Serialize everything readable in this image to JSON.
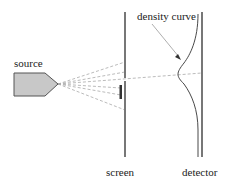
{
  "labels": {
    "source": "source",
    "density_curve": "density curve",
    "screen": "screen",
    "detector": "detector"
  },
  "colors": {
    "source_fill": "#c8c8c8",
    "line": "#555555",
    "dash": "#aaaaaa"
  }
}
